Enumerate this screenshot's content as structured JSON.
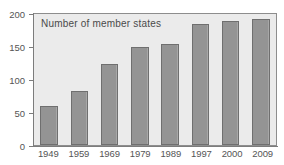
{
  "chart_data": {
    "type": "bar",
    "title": "",
    "legend_label": "Number of member states",
    "legend_position": "inside-top-left",
    "categories": [
      "1949",
      "1959",
      "1969",
      "1979",
      "1989",
      "1997",
      "2000",
      "2009"
    ],
    "values": [
      59,
      83,
      124,
      150,
      154,
      185,
      189,
      192
    ],
    "series": [
      {
        "name": "Number of member states",
        "values": [
          59,
          83,
          124,
          150,
          154,
          185,
          189,
          192
        ]
      }
    ],
    "xlabel": "",
    "ylabel": "",
    "ylim": [
      0,
      200
    ],
    "yticks": [
      0,
      50,
      100,
      150,
      200
    ],
    "ytick_labels": [
      "0",
      "50",
      "100",
      "150",
      "200"
    ],
    "grid": false,
    "bar_color": "#949494",
    "bar_border_color": "#6f6f6f",
    "plot_background": "#ebebeb",
    "axis_color": "#7c7c7c",
    "text_color": "#555555"
  }
}
